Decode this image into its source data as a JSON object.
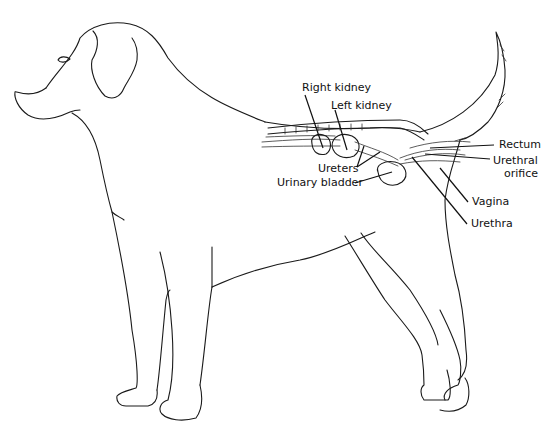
{
  "figure": {
    "labels": {
      "right_kidney": "Right kidney",
      "left_kidney": "Left kidney",
      "ureters": "Ureters",
      "urinary_bladder": "Urinary bladder",
      "rectum": "Rectum",
      "urethral_orifice_line1": "Urethral",
      "urethral_orifice_line2": "orifice",
      "vagina": "Vagina",
      "urethra": "Urethra"
    }
  }
}
